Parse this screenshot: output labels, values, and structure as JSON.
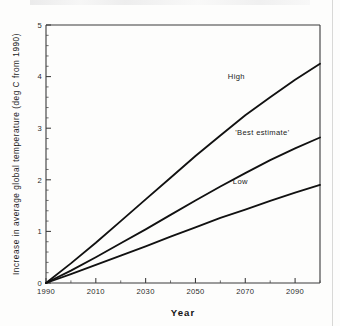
{
  "chart_data": {
    "type": "line",
    "title": "",
    "xlabel": "Year",
    "ylabel": "Increase in average global temperature (deg C from 1990)",
    "xlim": [
      1990,
      2100
    ],
    "ylim": [
      0,
      5
    ],
    "xticks": [
      1990,
      2010,
      2030,
      2050,
      2070,
      2090
    ],
    "xtick_labels": [
      "1990",
      "2010",
      "2030",
      "2050",
      "2070",
      "2090"
    ],
    "xminor_ticks": [
      2000,
      2020,
      2040,
      2060,
      2080,
      2100
    ],
    "yticks": [
      0,
      1,
      2,
      3,
      4,
      5
    ],
    "ytick_labels": [
      "0",
      "1",
      "2",
      "3",
      "4",
      "5"
    ],
    "yminor_step": 0.2,
    "grid": false,
    "legend_position": "inline-annotations",
    "x": [
      1990,
      2000,
      2010,
      2020,
      2030,
      2040,
      2050,
      2060,
      2070,
      2080,
      2090,
      2100
    ],
    "series": [
      {
        "name": "High",
        "label": "High",
        "color": "#111111",
        "values": [
          0.0,
          0.38,
          0.78,
          1.2,
          1.62,
          2.04,
          2.46,
          2.86,
          3.25,
          3.6,
          3.94,
          4.25
        ]
      },
      {
        "name": "Best estimate",
        "label": "'Best estimate'",
        "color": "#111111",
        "values": [
          0.0,
          0.24,
          0.5,
          0.77,
          1.04,
          1.32,
          1.6,
          1.87,
          2.13,
          2.38,
          2.61,
          2.82
        ]
      },
      {
        "name": "Low",
        "label": "Low",
        "color": "#111111",
        "values": [
          0.0,
          0.17,
          0.35,
          0.53,
          0.71,
          0.9,
          1.08,
          1.26,
          1.42,
          1.59,
          1.75,
          1.9
        ]
      }
    ],
    "annotations": [
      {
        "text": "High",
        "x": 2063,
        "y": 3.95
      },
      {
        "text": "'Best estimate'",
        "x": 2066,
        "y": 2.86
      },
      {
        "text": "Low",
        "x": 2065,
        "y": 1.92
      }
    ]
  },
  "figure": {
    "name": "global-temperature-projection-chart"
  }
}
